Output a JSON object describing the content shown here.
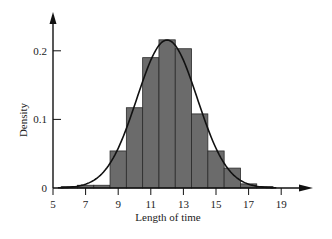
{
  "chart_data": {
    "type": "bar",
    "subtype": "histogram-with-density-curve",
    "title": "",
    "xlabel": "Length of time",
    "ylabel": "Density",
    "xlim": [
      5,
      19.5
    ],
    "ylim": [
      0,
      0.23
    ],
    "x_ticks": [
      5,
      7,
      9,
      11,
      13,
      15,
      17,
      19
    ],
    "y_ticks": [
      0,
      0.1,
      0.2
    ],
    "y_tick_labels": [
      "0",
      "0.1",
      "0.2"
    ],
    "grid": false,
    "legend": null,
    "bin_width": 1,
    "bins": [
      {
        "start": 5.5,
        "end": 6.5,
        "density": 0.002
      },
      {
        "start": 6.5,
        "end": 7.5,
        "density": 0.004
      },
      {
        "start": 7.5,
        "end": 8.5,
        "density": 0.004
      },
      {
        "start": 8.5,
        "end": 9.5,
        "density": 0.054
      },
      {
        "start": 9.5,
        "end": 10.5,
        "density": 0.117
      },
      {
        "start": 10.5,
        "end": 11.5,
        "density": 0.19
      },
      {
        "start": 11.5,
        "end": 12.5,
        "density": 0.216
      },
      {
        "start": 12.5,
        "end": 13.5,
        "density": 0.203
      },
      {
        "start": 13.5,
        "end": 14.5,
        "density": 0.108
      },
      {
        "start": 14.5,
        "end": 15.5,
        "density": 0.054
      },
      {
        "start": 15.5,
        "end": 16.5,
        "density": 0.029
      },
      {
        "start": 16.5,
        "end": 17.5,
        "density": 0.006
      },
      {
        "start": 17.5,
        "end": 18.5,
        "density": 0.002
      }
    ],
    "curve": {
      "type": "normal",
      "mean": 12,
      "sd": 1.85,
      "x_range": [
        5.3,
        18.7
      ]
    },
    "colors": {
      "bar_fill": "#6b6b6b",
      "bar_edge": "#2a2a2a",
      "curve": "#111111",
      "axis": "#111111"
    }
  }
}
